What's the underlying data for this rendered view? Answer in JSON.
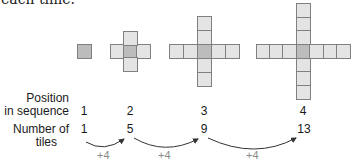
{
  "caption": "each time.",
  "colors": {
    "tile": "#e4e4e4",
    "center_tile": "#bcbcbc",
    "tile_border": "#808080",
    "difference_text": "#8a8a8a"
  },
  "row_labels": {
    "position": [
      "Position",
      "in sequence"
    ],
    "tiles": [
      "Number of",
      "tiles"
    ]
  },
  "figures": [
    {
      "position": "1",
      "tiles": "1"
    },
    {
      "position": "2",
      "tiles": "5"
    },
    {
      "position": "3",
      "tiles": "9"
    },
    {
      "position": "4",
      "tiles": "13"
    }
  ],
  "differences": [
    "+4",
    "+4",
    "+4"
  ]
}
